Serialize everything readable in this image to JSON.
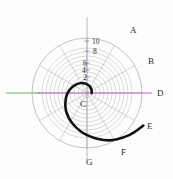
{
  "figure": {
    "title": "",
    "background": "#ffffff"
  },
  "chart_data": {
    "type": "line",
    "subtype": "polar-spiral",
    "title": "",
    "xlabel": "",
    "ylabel": "",
    "grid": true,
    "legend_position": "none",
    "polar": {
      "center_x": 87,
      "center_y": 93,
      "outer_radius": 55,
      "radial_ticks": [
        2,
        4,
        6,
        8,
        10
      ],
      "radial_tick_labels": [
        "2",
        "4",
        "6",
        "8",
        "10"
      ],
      "rlim": [
        0,
        12
      ],
      "angular_spokes_deg": [
        0,
        30,
        60,
        90,
        120,
        150,
        180,
        210,
        240,
        270,
        300,
        330
      ],
      "grid_circle_radii_px": [
        5,
        9,
        13,
        17,
        21,
        25,
        29,
        33,
        37,
        41,
        45,
        55
      ],
      "grid_color": "#9c9c9c",
      "spoke_color": "#9c9c9c"
    },
    "series": [
      {
        "name": "spiral",
        "color": "#111111",
        "width": 2.6,
        "description": "logarithmic spiral winding outward counterclockwise from origin",
        "polar_points_r_theta": [
          [
            1.0,
            0
          ],
          [
            1.1,
            20
          ],
          [
            1.3,
            45
          ],
          [
            1.6,
            70
          ],
          [
            2.0,
            95
          ],
          [
            2.5,
            120
          ],
          [
            3.1,
            145
          ],
          [
            3.9,
            170
          ],
          [
            4.8,
            195
          ],
          [
            6.0,
            220
          ],
          [
            7.4,
            245
          ],
          [
            9.2,
            270
          ],
          [
            11.4,
            295
          ],
          [
            13.0,
            315
          ],
          [
            14.2,
            330
          ]
        ]
      }
    ],
    "reference_lines": [
      {
        "name": "green-axis-left",
        "color": "#66bb55",
        "orientation": "horizontal",
        "x_start_px": 6,
        "x_end_px": 40,
        "y_px": 93
      },
      {
        "name": "magenta-axis",
        "color": "#c060c0",
        "orientation": "horizontal",
        "x_start_px": 38,
        "x_end_px": 152,
        "y_px": 93
      }
    ],
    "annotations": [
      {
        "label": "A",
        "x_px": 130,
        "y_px": 26,
        "angle_deg": 40
      },
      {
        "label": "B",
        "x_px": 148,
        "y_px": 57,
        "angle_deg": 10
      },
      {
        "label": "C",
        "x_px": 80,
        "y_px": 100,
        "angle_deg": 200
      },
      {
        "label": "D",
        "x_px": 157,
        "y_px": 89,
        "angle_deg": 0
      },
      {
        "label": "E",
        "x_px": 147,
        "y_px": 122,
        "angle_deg": -30
      },
      {
        "label": "F",
        "x_px": 121,
        "y_px": 148,
        "angle_deg": -55
      },
      {
        "label": "G",
        "x_px": 86,
        "y_px": 158,
        "angle_deg": -90
      }
    ],
    "radial_tick_positions_px": [
      {
        "label": "2",
        "x": 83,
        "y": 74
      },
      {
        "label": "4",
        "x": 82,
        "y": 67
      },
      {
        "label": "6",
        "x": 83,
        "y": 60
      },
      {
        "label": "8",
        "x": 93,
        "y": 48
      },
      {
        "label": "10",
        "x": 92,
        "y": 38
      }
    ]
  }
}
